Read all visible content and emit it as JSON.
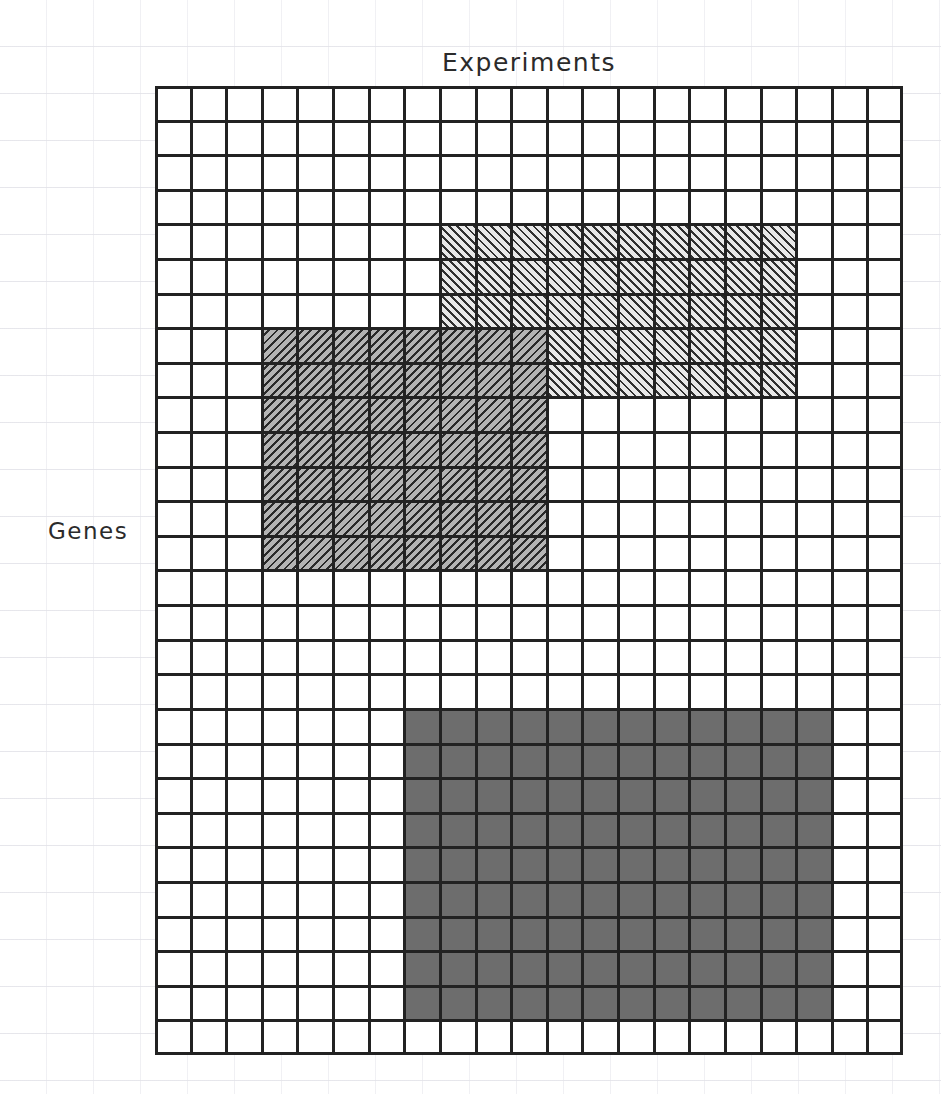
{
  "figure": {
    "x_axis_label": "Experiments",
    "y_axis_label": "Genes"
  },
  "chart_data": {
    "type": "heatmap",
    "title": "",
    "xlabel": "Experiments",
    "ylabel": "Genes",
    "grid": true,
    "legend_position": "none",
    "matrix": {
      "columns": 21,
      "rows": 28,
      "cell_width_px": 35.6,
      "cell_height_px": 34.6,
      "background_color": "#ffffff",
      "line_color": "#222222"
    },
    "blocks": [
      {
        "name": "bicluster-a",
        "style": "hatch-light",
        "fill_color": "#e9e9e9",
        "hatch_color": "#303030",
        "hatch_direction": "45deg",
        "col_start": 8,
        "col_end": 18,
        "row_start": 4,
        "row_end": 9,
        "col_span": 10,
        "row_span": 5
      },
      {
        "name": "bicluster-b",
        "style": "hatch-dark",
        "fill_color": "#b4b4b4",
        "hatch_color": "#2a2a2a",
        "hatch_direction": "-45deg",
        "col_start": 3,
        "col_end": 11,
        "row_start": 7,
        "row_end": 14,
        "col_span": 8,
        "row_span": 7
      },
      {
        "name": "bicluster-c",
        "style": "solid",
        "fill_color": "#6d6d6d",
        "hatch_color": "",
        "hatch_direction": "none",
        "col_start": 7,
        "col_end": 19,
        "row_start": 18,
        "row_end": 27,
        "col_span": 12,
        "row_span": 9
      }
    ]
  }
}
